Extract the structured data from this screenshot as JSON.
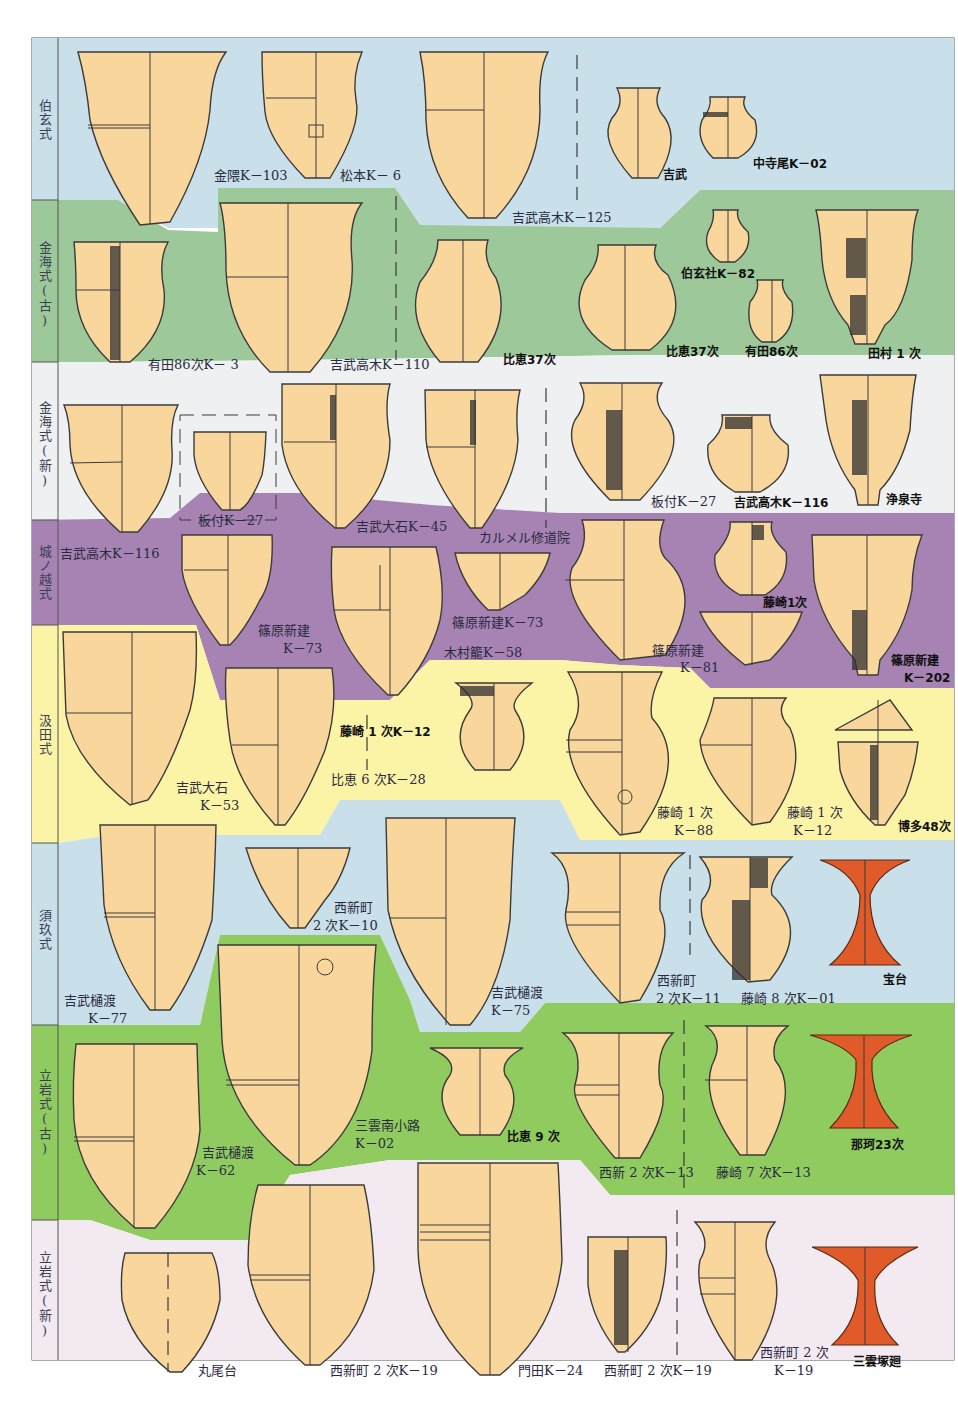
{
  "title_context": "Yayoi pottery typology chart by phase",
  "colors": {
    "band_blue": "#c9e0ea",
    "band_green_dark": "#9cc89a",
    "band_white": "#eef0f1",
    "band_purple": "#a683b3",
    "band_yellow": "#fbf4a6",
    "band_green_bright": "#8fcb5f",
    "band_pink": "#f3e9f1",
    "pot_fill": "#f9d79c",
    "pot_line": "#3b3b3b",
    "red_stand": "#e05a2a"
  },
  "phases": [
    {
      "label": "伯玄式"
    },
    {
      "label": "金海式(古)"
    },
    {
      "label": "金海式(新)"
    },
    {
      "label": "城ノ越式"
    },
    {
      "label": "汲田式"
    },
    {
      "label": "須玖式"
    },
    {
      "label": "立岩式(古)"
    },
    {
      "label": "立岩式(新)"
    }
  ],
  "labels": {
    "l1": "金隈K－103",
    "l2": "松本K－ 6",
    "l3": "吉武高木K－125",
    "l4": "吉武",
    "l5": "中寺尾K－02",
    "l6": "有田86次K－ 3",
    "l7": "吉武高木K－110",
    "l8": "比恵37次",
    "l9": "伯玄社K－82",
    "l10": "比恵37次",
    "l11": "有田86次",
    "l12": "田村 1 次",
    "l13": "板付K－27",
    "l14": "吉武大石K－45",
    "l15": "板付K－27",
    "l16": "吉武高木K－116",
    "l17": "浄泉寺",
    "l18": "吉武高木K－116",
    "l19": "カルメル修道院",
    "l20a": "篠原新建",
    "l20b": "K－73",
    "l21": "篠原新建K－73",
    "l22": "木村籠K－58",
    "l23a": "篠原新建",
    "l23b": "K－81",
    "l24": "藤崎1次",
    "l25a": "篠原新建",
    "l25b": "K－202",
    "l26a": "吉武大石",
    "l26b": "K－53",
    "l27": "藤崎 1 次K－12",
    "l28": "比恵 6 次K－28",
    "l29a": "藤崎 1 次",
    "l29b": "K－88",
    "l30a": "藤崎 1 次",
    "l30b": "K－12",
    "l31": "博多48次",
    "l32a": "吉武樋渡",
    "l32b": "K－77",
    "l33a": "西新町",
    "l33b": "2 次K－10",
    "l34a": "吉武樋渡",
    "l34b": "K－75",
    "l35a": "西新町",
    "l35b": "2 次K－11",
    "l36": "藤崎 8 次K－01",
    "l37": "宝台",
    "l38a": "吉武樋渡",
    "l38b": "K－62",
    "l39a": "三雲南小路",
    "l39b": "K－02",
    "l40": "比恵 9 次",
    "l41": "西新 2 次K－13",
    "l42": "藤崎 7 次K－13",
    "l43": "那珂23次",
    "l44": "丸尾台",
    "l45": "西新町 2 次K－19",
    "l46": "門田K－24",
    "l47": "西新町 2 次K－19",
    "l48a": "西新町 2 次",
    "l48b": "K－19",
    "l49": "三雲塚廻"
  }
}
